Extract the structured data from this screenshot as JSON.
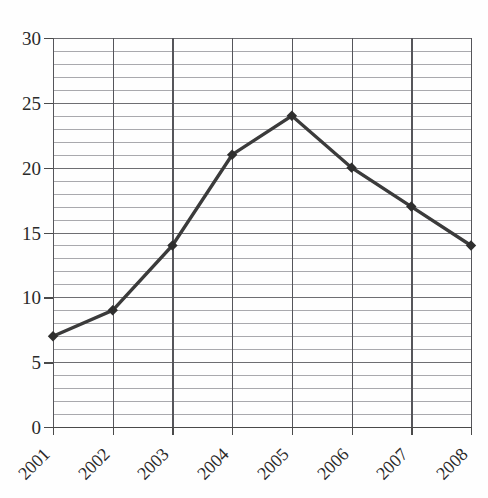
{
  "chart_data": {
    "type": "line",
    "title": "",
    "xlabel": "",
    "ylabel": "",
    "categories": [
      "2001",
      "2002",
      "2003",
      "2004",
      "2005",
      "2006",
      "2007",
      "2008"
    ],
    "values": [
      7,
      9,
      14,
      21,
      24,
      20,
      17,
      14
    ],
    "series": [
      {
        "name": "",
        "values": [
          7,
          9,
          14,
          21,
          24,
          20,
          17,
          14
        ]
      }
    ],
    "ylim": [
      0,
      30
    ],
    "ytick_labels": [
      "0",
      "5",
      "10",
      "15",
      "20",
      "25",
      "30"
    ],
    "ytick_values": [
      0,
      5,
      10,
      15,
      20,
      25,
      30
    ],
    "y_major_step": 5,
    "y_minor_step": 1,
    "grid": "both",
    "grid_horizontal": true,
    "grid_vertical": true,
    "legend": "none",
    "xtick_rotation": -45,
    "marker": "diamond",
    "line_color": "#3b3b3b",
    "marker_color": "#2e2e2e",
    "grid_color": "#8e8e92",
    "axis_color": "#4a4a4a",
    "background_color": "#fefefe"
  },
  "axes": {
    "y": {
      "labels": [
        "30",
        "25",
        "20",
        "15",
        "10",
        "5",
        "0"
      ]
    },
    "x": {
      "labels": [
        "2001",
        "2002",
        "2003",
        "2004",
        "2005",
        "2006",
        "2007",
        "2008"
      ]
    }
  }
}
